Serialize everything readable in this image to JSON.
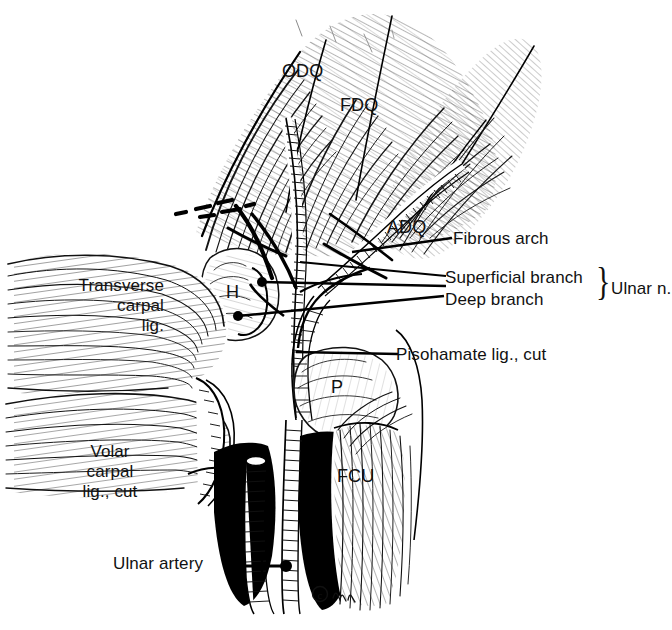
{
  "figure": {
    "background_color": "#ffffff",
    "ink_color": "#111111",
    "width": 672,
    "height": 630,
    "credit": "©"
  },
  "labels": {
    "odq": "ODQ",
    "fdq": "FDQ",
    "adq": "ADQ",
    "hamate": "H",
    "pisiform": "P",
    "fcu": "FCU",
    "fibrous_arch": "Fibrous arch",
    "superficial_branch": "Superficial branch",
    "deep_branch": "Deep branch",
    "ulnar_nerve": "Ulnar n.",
    "pisohamate": "Pisohamate lig., cut",
    "transverse_carpal_1": "Transverse",
    "transverse_carpal_2": "carpal",
    "transverse_carpal_3": "lig.",
    "volar_carpal_1": "Volar",
    "volar_carpal_2": "carpal",
    "volar_carpal_3": "lig., cut",
    "ulnar_artery": "Ulnar artery",
    "brace": "}"
  }
}
